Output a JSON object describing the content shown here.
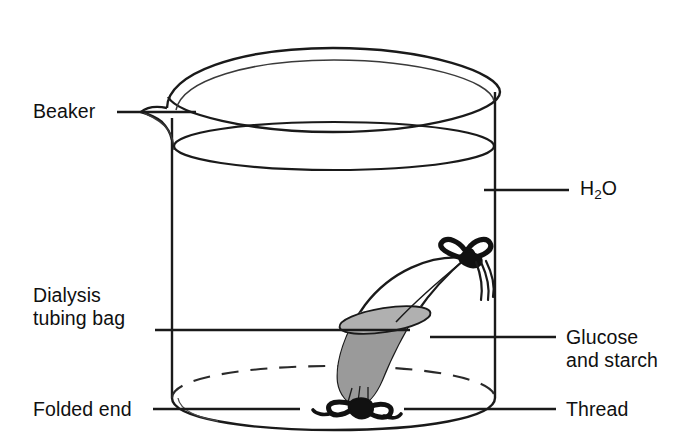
{
  "diagram": {
    "background_color": "#ffffff",
    "line_color": "#1a1a1a",
    "fill_color": "#9a9a9a",
    "thread_color": "#111111"
  },
  "labels": {
    "beaker": {
      "text": "Beaker",
      "side": "left"
    },
    "water": {
      "text_prefix": "H",
      "text_sub": "2",
      "text_suffix": "O",
      "side": "right"
    },
    "dialysis_bag": {
      "line1": "Dialysis",
      "line2": "tubing bag",
      "side": "left"
    },
    "contents": {
      "line1": "Glucose",
      "line2": "and starch",
      "side": "right"
    },
    "folded_end": {
      "text": "Folded end",
      "side": "left"
    },
    "thread": {
      "text": "Thread",
      "side": "right"
    }
  }
}
